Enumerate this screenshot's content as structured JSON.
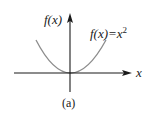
{
  "figure": {
    "caption": "(a)",
    "y_axis_label": "f(x)",
    "x_axis_label": "x",
    "curve_label": "f(x)=x",
    "curve_label_exponent": "2",
    "colors": {
      "axes": "#1a1a1a",
      "curve": "#8c8c8c",
      "background": "#ffffff"
    }
  }
}
